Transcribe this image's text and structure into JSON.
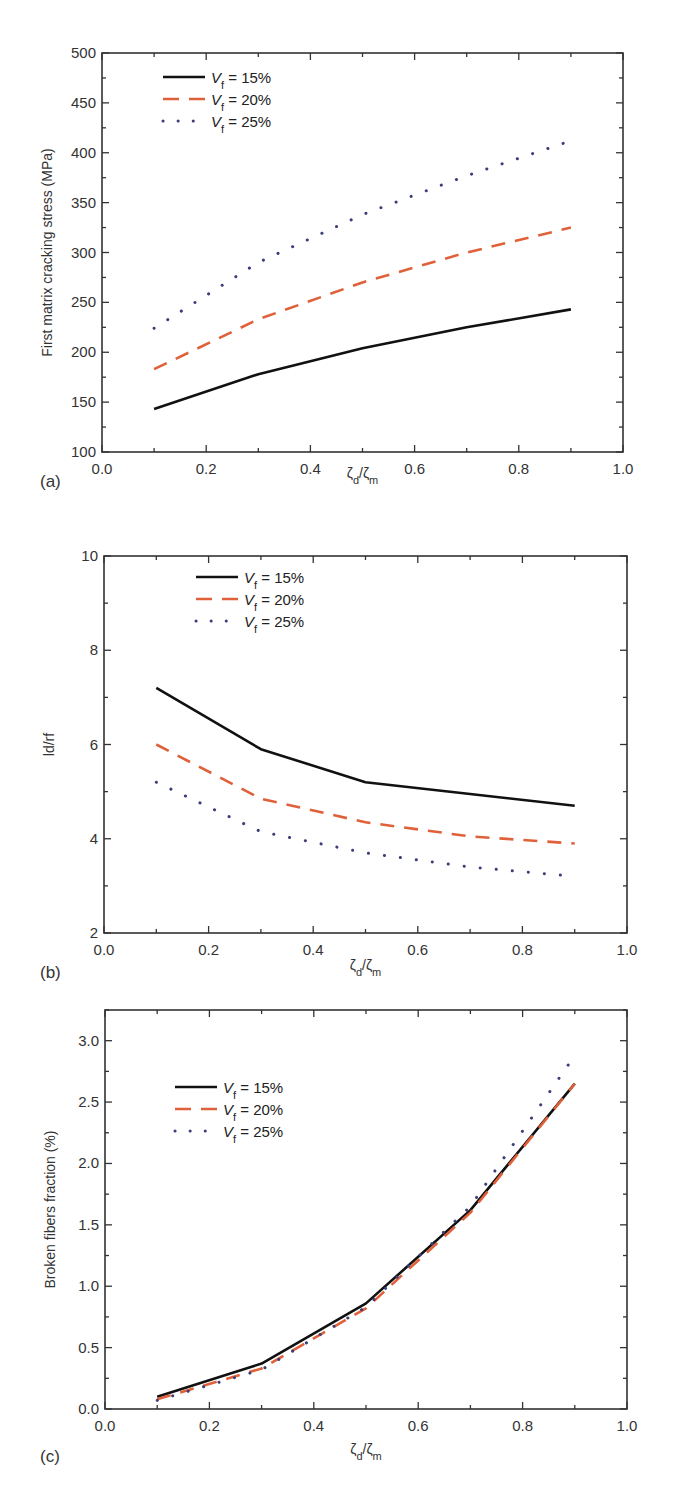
{
  "figure": {
    "panels": [
      "(a)",
      "(b)",
      "(c)"
    ]
  },
  "legend": [
    {
      "symbol": "V",
      "subscript": "f",
      "text": " = 15%",
      "color": "#111111",
      "style": "solid"
    },
    {
      "symbol": "V",
      "subscript": "f",
      "text": " = 20%",
      "color": "#e0603a",
      "style": "dashed"
    },
    {
      "symbol": "V",
      "subscript": "f",
      "text": " = 25%",
      "color": "#3a3f7a",
      "style": "dotted"
    }
  ],
  "chart_data": [
    {
      "panel": "(a)",
      "type": "line",
      "title": "",
      "xlabel": "ζd/ζm",
      "ylabel": "First matrix cracking stress (MPa)",
      "xlim": [
        0.0,
        1.0
      ],
      "ylim": [
        100,
        500
      ],
      "xticks": [
        "0.0",
        "0.2",
        "0.4",
        "0.6",
        "0.8",
        "1.0"
      ],
      "yticks": [
        "100",
        "150",
        "200",
        "250",
        "300",
        "350",
        "400",
        "450",
        "500"
      ],
      "grid": false,
      "legend_position": "upper left",
      "x": [
        0.1,
        0.3,
        0.5,
        0.7,
        0.9
      ],
      "series": [
        {
          "name": "Vf = 15%",
          "values": [
            143,
            178,
            204,
            225,
            243
          ]
        },
        {
          "name": "Vf = 20%",
          "values": [
            183,
            233,
            270,
            300,
            325
          ]
        },
        {
          "name": "Vf = 25%",
          "values": [
            224,
            290,
            338,
            377,
            412
          ]
        }
      ]
    },
    {
      "panel": "(b)",
      "type": "line",
      "title": "",
      "xlabel": "ζd/ζm",
      "ylabel": "ld/rf",
      "xlim": [
        0.0,
        1.0
      ],
      "ylim": [
        2,
        10
      ],
      "xticks": [
        "0.0",
        "0.2",
        "0.4",
        "0.6",
        "0.8",
        "1.0"
      ],
      "yticks": [
        "2",
        "4",
        "6",
        "8",
        "10"
      ],
      "grid": false,
      "legend_position": "upper center",
      "x": [
        0.1,
        0.3,
        0.5,
        0.7,
        0.9
      ],
      "series": [
        {
          "name": "Vf = 15%",
          "values": [
            7.2,
            5.9,
            5.2,
            4.95,
            4.7
          ]
        },
        {
          "name": "Vf = 20%",
          "values": [
            6.0,
            4.85,
            4.35,
            4.05,
            3.9
          ]
        },
        {
          "name": "Vf = 25%",
          "values": [
            5.2,
            4.15,
            3.7,
            3.4,
            3.2
          ]
        }
      ]
    },
    {
      "panel": "(c)",
      "type": "line",
      "title": "",
      "xlabel": "ζd/ζm",
      "ylabel": "Broken fibers fraction (%)",
      "xlim": [
        0.0,
        1.0
      ],
      "ylim": [
        0.0,
        3.25
      ],
      "xticks": [
        "0.0",
        "0.2",
        "0.4",
        "0.6",
        "0.8",
        "1.0"
      ],
      "yticks": [
        "0.0",
        "0.5",
        "1.0",
        "1.5",
        "2.0",
        "2.5",
        "3.0"
      ],
      "grid": false,
      "legend_position": "upper left",
      "x": [
        0.1,
        0.3,
        0.5,
        0.7,
        0.9
      ],
      "series": [
        {
          "name": "Vf = 15%",
          "values": [
            0.1,
            0.37,
            0.86,
            1.62,
            2.65
          ]
        },
        {
          "name": "Vf = 20%",
          "values": [
            0.08,
            0.33,
            0.82,
            1.6,
            2.65
          ]
        },
        {
          "name": "Vf = 25%",
          "values": [
            0.07,
            0.32,
            0.83,
            1.65,
            2.88
          ]
        }
      ]
    }
  ]
}
